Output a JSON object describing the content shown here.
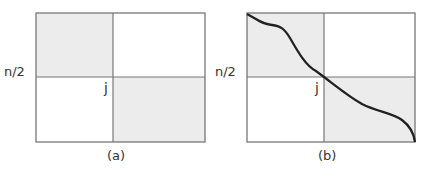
{
  "panels": [
    {
      "id": "a",
      "caption": "(a)",
      "y_label": "n/2",
      "point_label": "j",
      "shaded_quadrants": [
        "top-left",
        "bottom-right"
      ],
      "has_curve": false
    },
    {
      "id": "b",
      "caption": "(b)",
      "y_label": "n/2",
      "point_label": "j",
      "shaded_quadrants": [
        "top-left",
        "bottom-right"
      ],
      "has_curve": true
    }
  ],
  "colors": {
    "shade": "#ececec",
    "border": "#777777",
    "curve": "#222222"
  }
}
